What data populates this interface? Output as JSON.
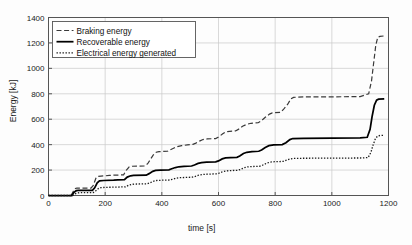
{
  "chart_data": {
    "type": "line",
    "title": "",
    "xlabel": "time [s]",
    "ylabel": "Energy [kJ]",
    "xlim": [
      0,
      1200
    ],
    "ylim": [
      0,
      1400
    ],
    "xticks": [
      0,
      200,
      400,
      600,
      800,
      1000,
      1200
    ],
    "yticks": [
      0,
      200,
      400,
      600,
      800,
      1000,
      1200,
      1400
    ],
    "grid": true,
    "legend_position": "upper left",
    "series": [
      {
        "name": "Braking energy",
        "style": "dashed",
        "color": "#3a3a3a",
        "points": [
          [
            0,
            0
          ],
          [
            80,
            0
          ],
          [
            88,
            35
          ],
          [
            95,
            55
          ],
          [
            100,
            58
          ],
          [
            150,
            58
          ],
          [
            158,
            80
          ],
          [
            168,
            140
          ],
          [
            175,
            150
          ],
          [
            185,
            152
          ],
          [
            200,
            155
          ],
          [
            215,
            158
          ],
          [
            230,
            160
          ],
          [
            265,
            162
          ],
          [
            275,
            200
          ],
          [
            285,
            225
          ],
          [
            295,
            230
          ],
          [
            340,
            232
          ],
          [
            350,
            250
          ],
          [
            360,
            285
          ],
          [
            370,
            320
          ],
          [
            380,
            340
          ],
          [
            390,
            345
          ],
          [
            420,
            348
          ],
          [
            430,
            360
          ],
          [
            445,
            375
          ],
          [
            455,
            385
          ],
          [
            470,
            392
          ],
          [
            490,
            398
          ],
          [
            510,
            402
          ],
          [
            520,
            412
          ],
          [
            535,
            430
          ],
          [
            545,
            440
          ],
          [
            560,
            445
          ],
          [
            590,
            448
          ],
          [
            600,
            460
          ],
          [
            615,
            485
          ],
          [
            625,
            500
          ],
          [
            640,
            505
          ],
          [
            660,
            508
          ],
          [
            670,
            520
          ],
          [
            685,
            545
          ],
          [
            700,
            560
          ],
          [
            715,
            568
          ],
          [
            740,
            572
          ],
          [
            750,
            585
          ],
          [
            765,
            615
          ],
          [
            780,
            640
          ],
          [
            790,
            650
          ],
          [
            820,
            655
          ],
          [
            830,
            680
          ],
          [
            845,
            720
          ],
          [
            855,
            760
          ],
          [
            865,
            772
          ],
          [
            900,
            775
          ],
          [
            1000,
            776
          ],
          [
            1100,
            778
          ],
          [
            1130,
            800
          ],
          [
            1140,
            900
          ],
          [
            1148,
            1050
          ],
          [
            1155,
            1180
          ],
          [
            1162,
            1245
          ],
          [
            1170,
            1252
          ],
          [
            1185,
            1255
          ]
        ]
      },
      {
        "name": "Recoverable energy",
        "style": "solid",
        "color": "#000000",
        "points": [
          [
            0,
            0
          ],
          [
            82,
            0
          ],
          [
            90,
            25
          ],
          [
            98,
            38
          ],
          [
            105,
            40
          ],
          [
            155,
            40
          ],
          [
            163,
            60
          ],
          [
            172,
            100
          ],
          [
            180,
            115
          ],
          [
            195,
            118
          ],
          [
            230,
            120
          ],
          [
            245,
            122
          ],
          [
            268,
            124
          ],
          [
            278,
            145
          ],
          [
            290,
            155
          ],
          [
            300,
            158
          ],
          [
            345,
            160
          ],
          [
            355,
            172
          ],
          [
            368,
            190
          ],
          [
            378,
            198
          ],
          [
            395,
            200
          ],
          [
            425,
            202
          ],
          [
            435,
            210
          ],
          [
            448,
            220
          ],
          [
            460,
            226
          ],
          [
            478,
            230
          ],
          [
            505,
            232
          ],
          [
            515,
            240
          ],
          [
            528,
            252
          ],
          [
            540,
            258
          ],
          [
            558,
            262
          ],
          [
            590,
            264
          ],
          [
            600,
            272
          ],
          [
            613,
            288
          ],
          [
            625,
            295
          ],
          [
            642,
            298
          ],
          [
            665,
            300
          ],
          [
            675,
            310
          ],
          [
            688,
            330
          ],
          [
            700,
            340
          ],
          [
            718,
            345
          ],
          [
            742,
            348
          ],
          [
            752,
            358
          ],
          [
            765,
            378
          ],
          [
            778,
            392
          ],
          [
            795,
            398
          ],
          [
            825,
            400
          ],
          [
            838,
            415
          ],
          [
            852,
            440
          ],
          [
            862,
            448
          ],
          [
            900,
            450
          ],
          [
            1000,
            452
          ],
          [
            1100,
            454
          ],
          [
            1125,
            458
          ],
          [
            1135,
            520
          ],
          [
            1142,
            620
          ],
          [
            1150,
            710
          ],
          [
            1158,
            750
          ],
          [
            1165,
            758
          ],
          [
            1185,
            760
          ]
        ]
      },
      {
        "name": "Electrical energy generated",
        "style": "dotted",
        "color": "#1a1a1a",
        "points": [
          [
            0,
            0
          ],
          [
            85,
            0
          ],
          [
            93,
            12
          ],
          [
            102,
            20
          ],
          [
            110,
            22
          ],
          [
            158,
            23
          ],
          [
            166,
            35
          ],
          [
            176,
            55
          ],
          [
            185,
            62
          ],
          [
            200,
            64
          ],
          [
            240,
            66
          ],
          [
            272,
            68
          ],
          [
            282,
            80
          ],
          [
            294,
            88
          ],
          [
            305,
            90
          ],
          [
            348,
            92
          ],
          [
            358,
            100
          ],
          [
            370,
            112
          ],
          [
            382,
            118
          ],
          [
            398,
            120
          ],
          [
            428,
            122
          ],
          [
            438,
            128
          ],
          [
            450,
            136
          ],
          [
            463,
            140
          ],
          [
            482,
            142
          ],
          [
            508,
            144
          ],
          [
            518,
            150
          ],
          [
            530,
            160
          ],
          [
            544,
            165
          ],
          [
            562,
            168
          ],
          [
            592,
            170
          ],
          [
            602,
            176
          ],
          [
            615,
            188
          ],
          [
            628,
            194
          ],
          [
            645,
            196
          ],
          [
            668,
            198
          ],
          [
            678,
            205
          ],
          [
            690,
            218
          ],
          [
            703,
            225
          ],
          [
            720,
            228
          ],
          [
            745,
            230
          ],
          [
            755,
            238
          ],
          [
            768,
            252
          ],
          [
            781,
            262
          ],
          [
            798,
            266
          ],
          [
            828,
            268
          ],
          [
            840,
            278
          ],
          [
            854,
            288
          ],
          [
            866,
            292
          ],
          [
            900,
            293
          ],
          [
            1000,
            294
          ],
          [
            1100,
            295
          ],
          [
            1128,
            298
          ],
          [
            1138,
            340
          ],
          [
            1146,
            400
          ],
          [
            1154,
            448
          ],
          [
            1162,
            468
          ],
          [
            1170,
            472
          ],
          [
            1185,
            473
          ]
        ]
      }
    ]
  },
  "legend": {
    "items": [
      {
        "label": "Braking energy"
      },
      {
        "label": "Recoverable energy"
      },
      {
        "label": "Electrical energy generated"
      }
    ]
  }
}
